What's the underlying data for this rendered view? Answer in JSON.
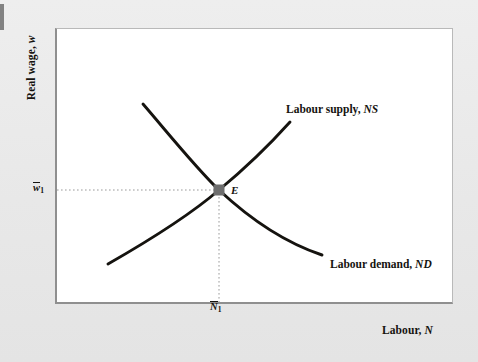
{
  "figure": {
    "kind": "economics-supply-demand-diagram",
    "background_color": "#e9e9e9",
    "panel_color": "#ffffff",
    "panel_border_color": "#8f8f8f",
    "curve_color": "#15130f",
    "guide_color": "#9a9a9a",
    "marker_color": "#6e6e6e"
  },
  "axes": {
    "y_title_text": "Real wage,",
    "y_title_symbol": "w",
    "x_title_text": "Labour,",
    "x_title_symbol": "N",
    "y_tick": {
      "symbol": "w",
      "subscript": "1",
      "overbar": true
    },
    "x_tick": {
      "symbol": "N",
      "subscript": "1",
      "overbar": true
    }
  },
  "curves": [
    {
      "name": "labour-supply",
      "label_text": "Labour supply,",
      "label_symbol": "NS",
      "slope": "upward",
      "path": "M 108 264 C 150 240, 190 215, 219 190 C 248 166, 272 142, 290 122"
    },
    {
      "name": "labour-demand",
      "label_text": "Labour demand,",
      "label_symbol": "ND",
      "slope": "downward",
      "path": "M 143 104 C 168 133, 196 168, 219 190 C 250 219, 286 243, 322 255"
    }
  ],
  "equilibrium": {
    "name": "E",
    "label": "E",
    "x_px": 219,
    "y_px": 190,
    "guides": {
      "horizontal_from_x": 57,
      "vertical_to_y": 302
    }
  }
}
